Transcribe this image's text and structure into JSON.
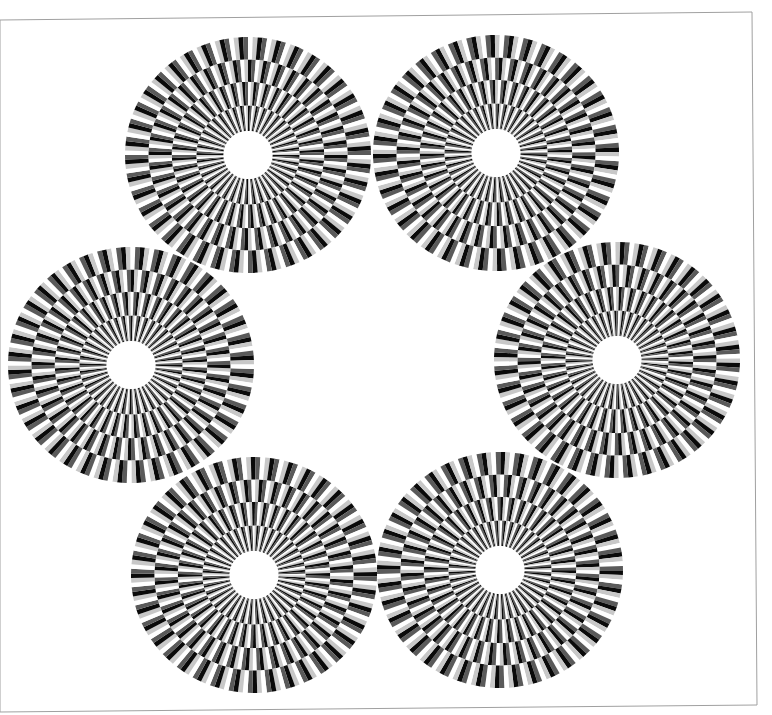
{
  "illusion": {
    "type": "rotating-disks-peripheral-drift",
    "background": "#ffffff",
    "border_color": "#a0a0a0",
    "frame": {
      "x1": 0,
      "y1": 20,
      "x2": 752,
      "y2": 12,
      "x3": 757,
      "y3": 705,
      "x4": 0,
      "y4": 712
    },
    "palette": [
      "#0a0a0a",
      "#5a5a5a",
      "#ffffff",
      "#c8c8c8"
    ],
    "sectors": 40,
    "hole_radius": 24,
    "ring_fractions": [
      0.2,
      0.42,
      0.62,
      0.81,
      1.0
    ],
    "disks": [
      {
        "id": "disk-top-left",
        "cx": 248,
        "cy": 155,
        "rx": 123,
        "ry": 118,
        "rotation": 0,
        "direction": 1
      },
      {
        "id": "disk-top-right",
        "cx": 496,
        "cy": 153,
        "rx": 123,
        "ry": 118,
        "rotation": 4,
        "direction": -1
      },
      {
        "id": "disk-middle-left",
        "cx": 131,
        "cy": 365,
        "rx": 123,
        "ry": 118,
        "rotation": 2,
        "direction": -1
      },
      {
        "id": "disk-middle-right",
        "cx": 617,
        "cy": 360,
        "rx": 123,
        "ry": 118,
        "rotation": 6,
        "direction": 1
      },
      {
        "id": "disk-bottom-left",
        "cx": 254,
        "cy": 575,
        "rx": 123,
        "ry": 118,
        "rotation": 3,
        "direction": 1
      },
      {
        "id": "disk-bottom-right",
        "cx": 500,
        "cy": 570,
        "rx": 123,
        "ry": 118,
        "rotation": 7,
        "direction": -1
      }
    ]
  }
}
